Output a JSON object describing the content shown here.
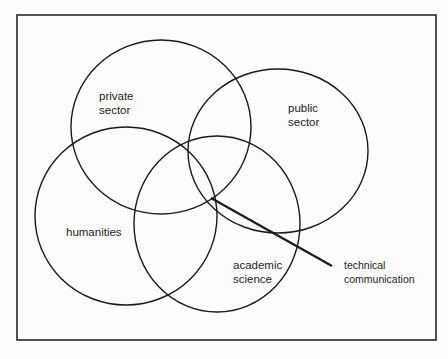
{
  "diagram": {
    "type": "venn",
    "sets": [
      {
        "id": "private",
        "label_lines": [
          "private",
          "sector"
        ]
      },
      {
        "id": "public",
        "label_lines": [
          "public",
          "sector"
        ]
      },
      {
        "id": "humanities",
        "label_lines": [
          "humanities"
        ]
      },
      {
        "id": "academic",
        "label_lines": [
          "academic",
          "science"
        ]
      }
    ],
    "callout": {
      "label_lines": [
        "technical",
        "communication"
      ],
      "points_to": "intersection of all four sets"
    }
  },
  "colors": {
    "stroke": "#1a1a1a",
    "background": "#fdfdfd",
    "text": "#222222"
  }
}
